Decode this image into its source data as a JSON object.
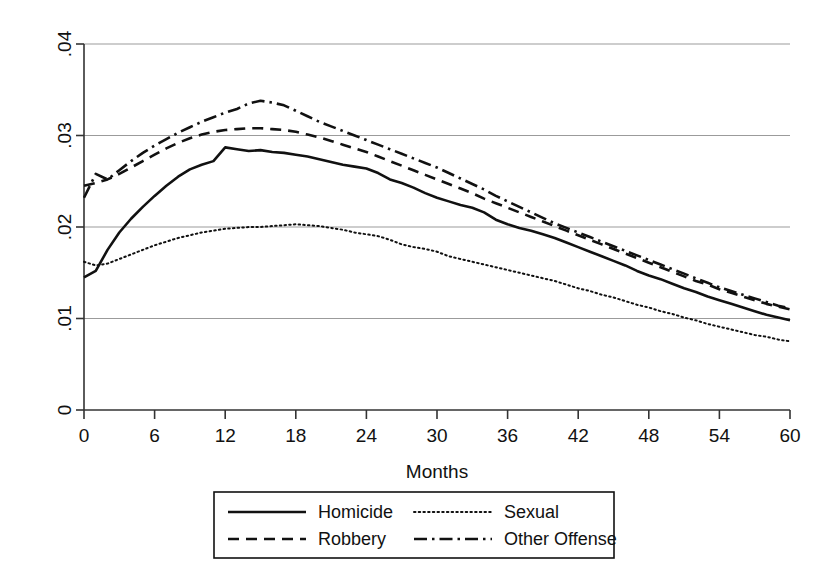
{
  "chart_data": {
    "type": "line",
    "title": "",
    "subtitle": "",
    "xlabel": "Months",
    "ylabel": "",
    "xlim": [
      0,
      60
    ],
    "ylim": [
      0,
      0.04
    ],
    "xticks": [
      0,
      6,
      12,
      18,
      24,
      30,
      36,
      42,
      48,
      54,
      60
    ],
    "xtick_labels": [
      "0",
      "6",
      "12",
      "18",
      "24",
      "30",
      "36",
      "42",
      "48",
      "54",
      "60"
    ],
    "yticks": [
      0,
      0.01,
      0.02,
      0.03,
      0.04
    ],
    "ytick_labels": [
      "0",
      ".01",
      ".02",
      ".03",
      ".04"
    ],
    "grid": "horizontal",
    "legend_position": "below-center",
    "x": [
      0,
      1,
      2,
      3,
      4,
      5,
      6,
      7,
      8,
      9,
      10,
      11,
      12,
      13,
      14,
      15,
      16,
      17,
      18,
      19,
      20,
      21,
      22,
      23,
      24,
      25,
      26,
      27,
      28,
      29,
      30,
      31,
      32,
      33,
      34,
      35,
      36,
      37,
      38,
      39,
      40,
      41,
      42,
      43,
      44,
      45,
      46,
      47,
      48,
      49,
      50,
      51,
      52,
      53,
      54,
      55,
      56,
      57,
      58,
      59,
      60
    ],
    "series": [
      {
        "name": "Homicide",
        "style": "solid",
        "values": [
          0.0145,
          0.0152,
          0.0175,
          0.0194,
          0.0209,
          0.0222,
          0.0234,
          0.0245,
          0.0255,
          0.0263,
          0.0268,
          0.0272,
          0.0287,
          0.0285,
          0.0283,
          0.0284,
          0.0282,
          0.0281,
          0.0279,
          0.0277,
          0.0274,
          0.0271,
          0.0268,
          0.0266,
          0.0264,
          0.0259,
          0.0252,
          0.0248,
          0.0243,
          0.0237,
          0.0232,
          0.0228,
          0.0224,
          0.0221,
          0.0216,
          0.0208,
          0.0203,
          0.0199,
          0.0196,
          0.0192,
          0.0188,
          0.0183,
          0.0178,
          0.0173,
          0.0168,
          0.0163,
          0.0158,
          0.0152,
          0.0147,
          0.0143,
          0.0138,
          0.0133,
          0.0129,
          0.0124,
          0.012,
          0.0116,
          0.0112,
          0.0108,
          0.0104,
          0.0101,
          0.0098
        ]
      },
      {
        "name": "Sexual",
        "style": "dotted",
        "values": [
          0.0162,
          0.0158,
          0.016,
          0.0165,
          0.017,
          0.0175,
          0.018,
          0.0184,
          0.0188,
          0.0191,
          0.0194,
          0.0196,
          0.0198,
          0.0199,
          0.02,
          0.02,
          0.0201,
          0.0202,
          0.0203,
          0.0202,
          0.0201,
          0.0199,
          0.0197,
          0.0194,
          0.0192,
          0.019,
          0.0186,
          0.0181,
          0.0178,
          0.0176,
          0.0173,
          0.0168,
          0.0165,
          0.0162,
          0.0159,
          0.0156,
          0.0153,
          0.015,
          0.0147,
          0.0144,
          0.0141,
          0.0137,
          0.0133,
          0.013,
          0.0126,
          0.0123,
          0.0119,
          0.0115,
          0.0112,
          0.0108,
          0.0105,
          0.0101,
          0.0098,
          0.0094,
          0.0091,
          0.0088,
          0.0085,
          0.0082,
          0.008,
          0.0077,
          0.0075
        ]
      },
      {
        "name": "Robbery",
        "style": "dashed",
        "values": [
          0.0245,
          0.0248,
          0.0252,
          0.0258,
          0.0265,
          0.0272,
          0.0279,
          0.0286,
          0.0292,
          0.0297,
          0.0301,
          0.0304,
          0.0306,
          0.0307,
          0.0308,
          0.0308,
          0.0307,
          0.0306,
          0.0304,
          0.0301,
          0.0298,
          0.0294,
          0.029,
          0.0286,
          0.0282,
          0.0277,
          0.0272,
          0.0267,
          0.0262,
          0.0257,
          0.0252,
          0.0247,
          0.0242,
          0.0237,
          0.0231,
          0.0226,
          0.0221,
          0.0216,
          0.0211,
          0.0206,
          0.0201,
          0.0196,
          0.0191,
          0.0186,
          0.0181,
          0.0176,
          0.0171,
          0.0166,
          0.0161,
          0.0156,
          0.0151,
          0.0146,
          0.0141,
          0.0137,
          0.0132,
          0.0128,
          0.0124,
          0.012,
          0.0116,
          0.0113,
          0.011
        ]
      },
      {
        "name": "Other Offense",
        "style": "dashdot",
        "values": [
          0.0232,
          0.0258,
          0.0252,
          0.0262,
          0.0272,
          0.0281,
          0.0289,
          0.0296,
          0.0303,
          0.0309,
          0.0315,
          0.032,
          0.0325,
          0.0329,
          0.0335,
          0.0338,
          0.0336,
          0.0333,
          0.0327,
          0.0321,
          0.0315,
          0.031,
          0.0305,
          0.03,
          0.0295,
          0.029,
          0.0285,
          0.028,
          0.0275,
          0.027,
          0.0265,
          0.0259,
          0.0253,
          0.0247,
          0.0241,
          0.0234,
          0.0228,
          0.0222,
          0.0216,
          0.021,
          0.0204,
          0.0199,
          0.0194,
          0.0189,
          0.0184,
          0.0179,
          0.0174,
          0.0169,
          0.0164,
          0.0159,
          0.0154,
          0.0149,
          0.0144,
          0.0139,
          0.0134,
          0.013,
          0.0126,
          0.0122,
          0.0118,
          0.0114,
          0.0111
        ]
      }
    ],
    "legend": [
      {
        "label": "Homicide",
        "style": "solid"
      },
      {
        "label": "Sexual",
        "style": "dotted"
      },
      {
        "label": "Robbery",
        "style": "dashed"
      },
      {
        "label": "Other Offense",
        "style": "dashdot"
      }
    ]
  }
}
